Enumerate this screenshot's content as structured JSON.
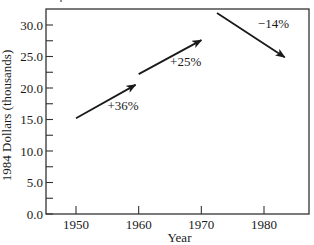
{
  "chart_data": {
    "type": "line",
    "title": "",
    "xlabel": "Year",
    "ylabel": "1984 Dollars (thousands)",
    "xlim": [
      1945,
      1987
    ],
    "ylim": [
      0,
      31.5
    ],
    "x_ticks": [
      1950,
      1960,
      1970,
      1980
    ],
    "x_tick_labels": [
      "1950",
      "1960",
      "1970",
      "1980"
    ],
    "y_ticks": [
      0,
      5,
      10,
      15,
      20,
      25,
      30
    ],
    "y_tick_labels": [
      "0.0",
      "5.0",
      "10.0",
      "15.0",
      "20.0",
      "25.0",
      "30.0"
    ],
    "y_minor_step": 2.5,
    "grid": false,
    "legend": null,
    "series": [
      {
        "name": "1950s",
        "x": [
          1950,
          1959.5
        ],
        "y": [
          15.2,
          20.5
        ],
        "label": "+36%",
        "label_pos": [
          1957.5,
          16.5
        ]
      },
      {
        "name": "1960s",
        "x": [
          1960,
          1970
        ],
        "y": [
          22.2,
          27.6
        ],
        "label": "+25%",
        "label_pos": [
          1967.5,
          23.5
        ]
      },
      {
        "name": "1970s-80s",
        "x": [
          1972.5,
          1983.3
        ],
        "y": [
          31.9,
          24.9
        ],
        "label": "−14%",
        "label_pos": [
          1981.5,
          29.5
        ]
      }
    ]
  }
}
